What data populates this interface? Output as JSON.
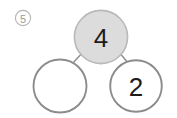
{
  "page": {
    "background_color": "#ffffff",
    "width": 177,
    "height": 118
  },
  "problem": {
    "number_label": "5",
    "label_shape": "circled-number",
    "label_color": "#9a9a9a"
  },
  "diagram": {
    "type": "number-bond",
    "stroke_color": "#8c8c8c",
    "filled_color": "#dcdcdc",
    "empty_color": "#ffffff",
    "digit_color": "#1c1c1c",
    "nodes": [
      {
        "id": "total",
        "position": "top",
        "value": "4",
        "filled": true,
        "cx": 101,
        "cy": 37,
        "r": 27
      },
      {
        "id": "part-left",
        "position": "bottom-left",
        "value": "",
        "filled": false,
        "cx": 60,
        "cy": 86,
        "r": 27
      },
      {
        "id": "part-right",
        "position": "bottom-right",
        "value": "2",
        "filled": false,
        "cx": 136,
        "cy": 86,
        "r": 26
      }
    ],
    "connectors": [
      {
        "id": "total-to-left",
        "x1": 84,
        "y1": 51,
        "x2": 72,
        "y2": 64
      },
      {
        "id": "total-to-right",
        "x1": 118,
        "y1": 51,
        "x2": 129,
        "y2": 64
      }
    ]
  }
}
